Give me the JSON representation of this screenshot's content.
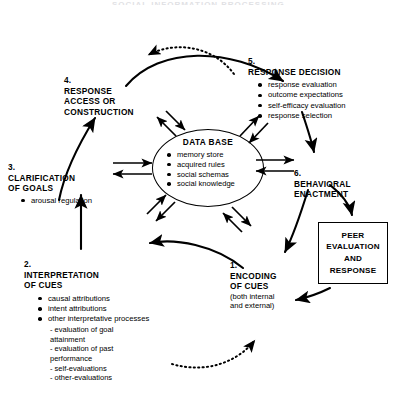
{
  "figure": {
    "clipped_title": "SOCIAL INFORMATION PROCESSING",
    "database": {
      "title": "DATA BASE",
      "items": [
        "memory store",
        "acquired rules",
        "social schemas",
        "social knowledge"
      ]
    },
    "peer_box": {
      "label": "PEER\nEVALUATION\nAND\nRESPONSE"
    },
    "nodes": [
      {
        "id": "node1",
        "number": "1.",
        "title": "ENCODING\nOF CUES",
        "subtitle": "(both internal\nand external)",
        "items": []
      },
      {
        "id": "node2",
        "number": "2.",
        "title": "INTERPRETATION\nOF CUES",
        "items": [
          "causal attributions",
          "intent attributions",
          "other interpretative processes"
        ],
        "subitems": [
          "- evaluation of goal\n      attainment",
          "- evaluation of past\n      performance",
          "- self-evaluations",
          "- other-evaluations"
        ]
      },
      {
        "id": "node3",
        "number": "3.",
        "title": "CLARIFICATION\nOF GOALS",
        "items": [
          "arousal regulation"
        ]
      },
      {
        "id": "node4",
        "number": "4.",
        "title": "RESPONSE\nACCESS OR\nCONSTRUCTION",
        "items": []
      },
      {
        "id": "node5",
        "number": "5.",
        "title": "RESPONSE DECISION",
        "items": [
          "response evaluation",
          "outcome expectations",
          "self-efficacy evaluation",
          "response selection"
        ]
      },
      {
        "id": "node6",
        "number": "6.",
        "title": "BEHAVIORAL\nENACTMENT",
        "items": []
      }
    ],
    "colors": {
      "ink": "#000000",
      "background": "#ffffff",
      "faint_title": "#c9c9cf"
    }
  }
}
